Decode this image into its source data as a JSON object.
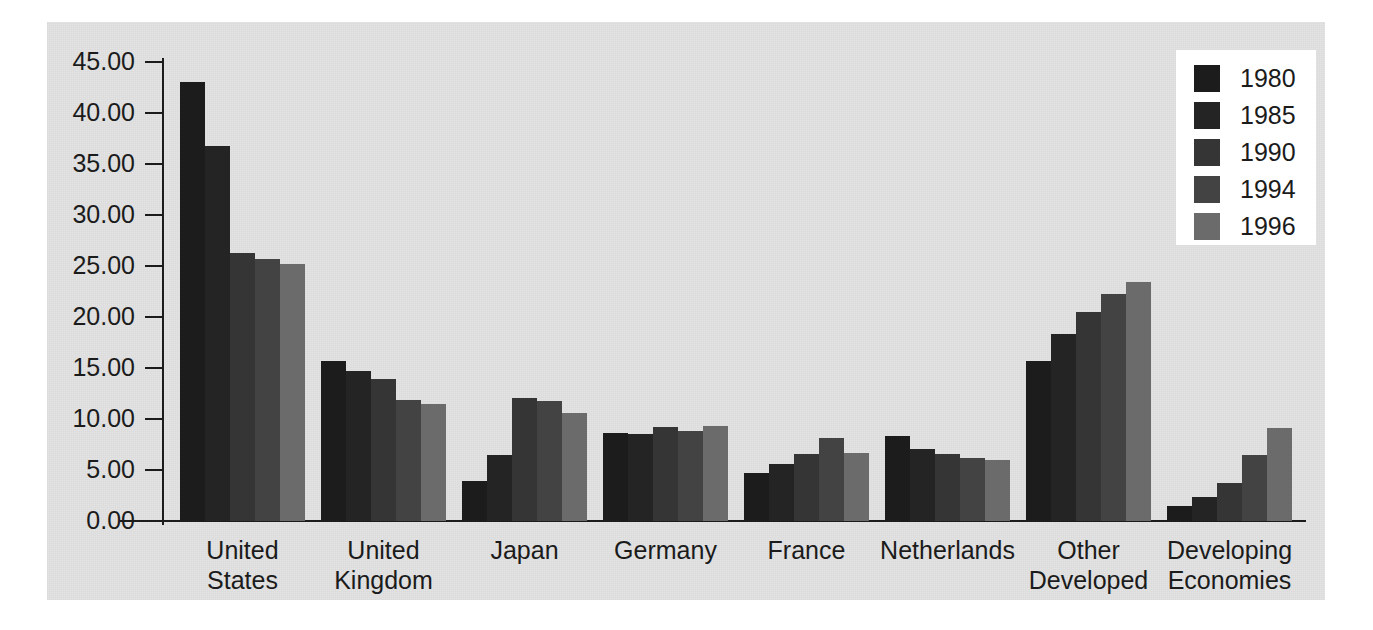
{
  "chart_data": {
    "type": "bar",
    "title": "",
    "subtitle": "",
    "xlabel": "",
    "ylabel": "",
    "ylim": [
      0,
      45
    ],
    "grid": false,
    "legend_position": "top-right",
    "categories": [
      "United States",
      "United Kingdom",
      "Japan",
      "Germany",
      "France",
      "Netherlands",
      "Other Developed",
      "Developing Economies"
    ],
    "category_lines": [
      [
        "United",
        "States"
      ],
      [
        "United",
        "Kingdom"
      ],
      [
        "Japan"
      ],
      [
        "Germany"
      ],
      [
        "France"
      ],
      [
        "Netherlands"
      ],
      [
        "Other",
        "Developed"
      ],
      [
        "Developing",
        "Economies"
      ]
    ],
    "ytick_labels": [
      "45.00",
      "40.00",
      "35.00",
      "30.00",
      "25.00",
      "20.00",
      "15.00",
      "10.00",
      "5.00",
      "0.00"
    ],
    "ytick_values": [
      45,
      40,
      35,
      30,
      25,
      20,
      15,
      10,
      5,
      0
    ],
    "series": [
      {
        "name": "1980",
        "color": "#1c1c1c",
        "values": [
          43.0,
          15.7,
          3.9,
          8.6,
          4.7,
          8.3,
          15.7,
          1.5
        ]
      },
      {
        "name": "1985",
        "color": "#242424",
        "values": [
          36.8,
          14.7,
          6.5,
          8.5,
          5.6,
          7.1,
          18.3,
          2.4
        ]
      },
      {
        "name": "1990",
        "color": "#353535",
        "values": [
          26.3,
          13.9,
          12.1,
          9.2,
          6.6,
          6.6,
          20.5,
          3.7
        ]
      },
      {
        "name": "1994",
        "color": "#434343",
        "values": [
          25.7,
          11.9,
          11.8,
          8.8,
          8.1,
          6.2,
          22.3,
          6.5
        ]
      },
      {
        "name": "1996",
        "color": "#6b6b6b",
        "values": [
          25.2,
          11.5,
          10.6,
          9.3,
          6.7,
          6.0,
          23.4,
          9.1
        ]
      }
    ]
  },
  "legend": {
    "entries": [
      {
        "label": "1980",
        "color": "#1c1c1c"
      },
      {
        "label": "1985",
        "color": "#242424"
      },
      {
        "label": "1990",
        "color": "#353535"
      },
      {
        "label": "1994",
        "color": "#434343"
      },
      {
        "label": "1996",
        "color": "#6b6b6b"
      }
    ]
  },
  "colors": {
    "panel_background": "#e3e3e3",
    "page_background": "#ffffff",
    "axis": "#1b1b1b",
    "text": "#1b1b1b",
    "legend_background": "#ffffff"
  }
}
